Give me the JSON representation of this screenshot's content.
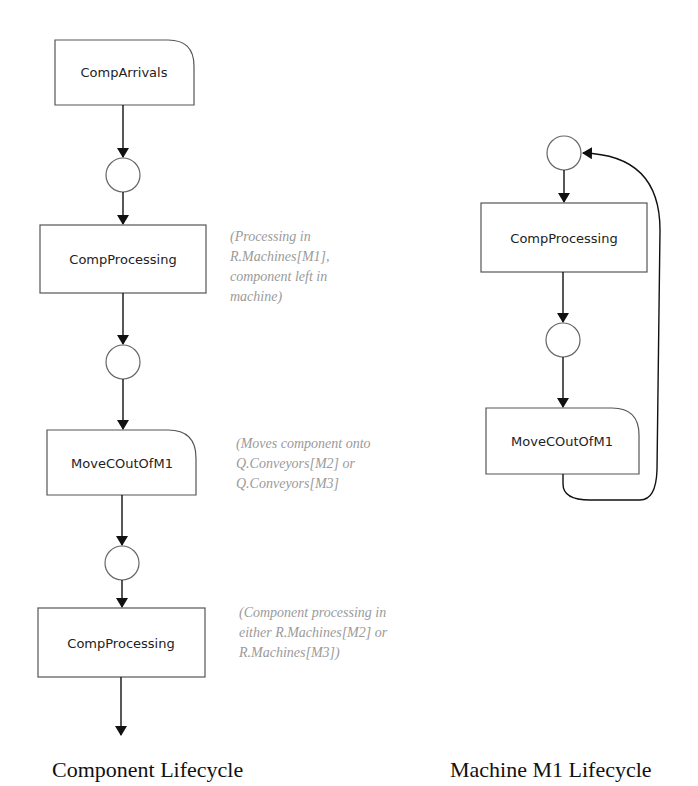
{
  "diagram": {
    "component_lifecycle": {
      "title": "Component Lifecycle",
      "nodes": [
        {
          "id": "comp-arrivals",
          "label": "CompArrivals",
          "shape": "rounded-top-right-box"
        },
        {
          "id": "place-1",
          "label": "",
          "shape": "circle"
        },
        {
          "id": "comp-processing-1",
          "label": "CompProcessing",
          "shape": "box"
        },
        {
          "id": "place-2",
          "label": "",
          "shape": "circle"
        },
        {
          "id": "move-c-out-of-m1",
          "label": "MoveCOutOfM1",
          "shape": "rounded-top-right-box"
        },
        {
          "id": "place-3",
          "label": "",
          "shape": "circle"
        },
        {
          "id": "comp-processing-2",
          "label": "CompProcessing",
          "shape": "box"
        }
      ],
      "annotations": [
        {
          "target": "comp-processing-1",
          "lines": [
            "(Processing in",
            "R.Machines[M1],",
            "component left in",
            "machine)"
          ]
        },
        {
          "target": "move-c-out-of-m1",
          "lines": [
            "(Moves component onto",
            "Q.Conveyors[M2] or",
            "Q.Conveyors[M3]"
          ]
        },
        {
          "target": "comp-processing-2",
          "lines": [
            "(Component processing in",
            "either R.Machines[M2] or",
            "R.Machines[M3])"
          ]
        }
      ]
    },
    "machine_m1_lifecycle": {
      "title": "Machine M1 Lifecycle",
      "nodes": [
        {
          "id": "m1-place-1",
          "label": "",
          "shape": "circle"
        },
        {
          "id": "m1-comp-processing",
          "label": "CompProcessing",
          "shape": "box"
        },
        {
          "id": "m1-place-2",
          "label": "",
          "shape": "circle"
        },
        {
          "id": "m1-move-c-out-of-m1",
          "label": "MoveCOutOfM1",
          "shape": "rounded-top-right-box"
        }
      ],
      "loop": {
        "from": "m1-move-c-out-of-m1",
        "to": "m1-place-1"
      }
    },
    "colors": {
      "box_stroke": "#555555",
      "edge": "#111111",
      "annotation_text": "#9a9a9a",
      "label_text": "#222222"
    }
  }
}
